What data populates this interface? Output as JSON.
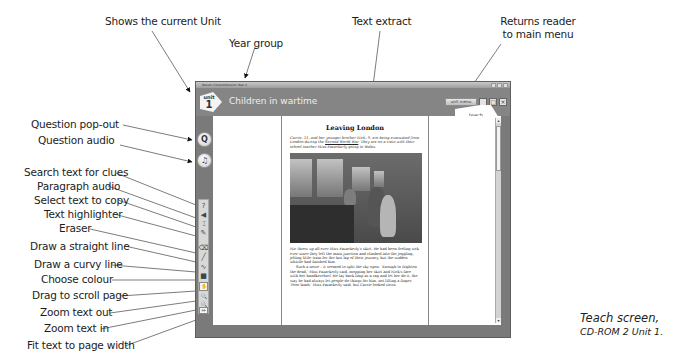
{
  "callouts": {
    "shows_unit": "Shows the current Unit",
    "year_group": "Year group",
    "text_extract": "Text extract",
    "returns_menu_l1": "Returns reader",
    "returns_menu_l2": "to main menu",
    "question_popout": "Question pop-out",
    "question_audio": "Question audio",
    "search_clues": "Search text for clues",
    "paragraph_audio": "Paragraph audio",
    "select_copy": "Select text to copy",
    "highlighter": "Text highlighter",
    "eraser": "Eraser",
    "straight_line": "Draw a straight line",
    "curvy_line": "Draw a curvy line",
    "choose_colour": "Choose colour",
    "drag_scroll": "Drag to scroll page",
    "zoom_out": "Zoom text out",
    "zoom_in": "Zoom text in",
    "fit_width": "Fit text to page width"
  },
  "window": {
    "title": "Nelson Comprehension Year 4",
    "unit_word": "unit",
    "unit_number": "1",
    "unit_title": "Children in wartime",
    "menu_button": "unit menu",
    "minimize": "_",
    "maximize": "□",
    "close": "×",
    "tab": "teach"
  },
  "round_buttons": {
    "question": "Q",
    "audio": "♫"
  },
  "tools": [
    {
      "name": "search-clues-icon",
      "glyph": "?"
    },
    {
      "name": "paragraph-audio-icon",
      "glyph": "◀"
    },
    {
      "name": "select-copy-icon",
      "glyph": "⌶"
    },
    {
      "name": "highlighter-icon",
      "glyph": "✎"
    },
    {
      "name": "eraser-icon",
      "glyph": "⌫"
    },
    {
      "name": "straight-line-icon",
      "glyph": "╱"
    },
    {
      "name": "curvy-line-icon",
      "glyph": "∿"
    },
    {
      "name": "colour-swatch-icon",
      "glyph": "■"
    },
    {
      "name": "hand-drag-icon",
      "glyph": "✋"
    },
    {
      "name": "zoom-out-icon",
      "glyph": "🔍"
    },
    {
      "name": "zoom-in-icon",
      "glyph": "🔍"
    },
    {
      "name": "fit-width-icon",
      "glyph": "⇔"
    }
  ],
  "page": {
    "title": "Leaving London",
    "intro_1": "Carrie, 11, and her younger brother Nick, 9, are being evacuated from London during the ",
    "intro_link": "Second World War",
    "intro_2": ". They are on a train with their school teacher Miss Fazackerly going to Wales.",
    "para_1": "Nic threw up all over Miss Fazackerly's skirt. He had been feeling sick ever since they left the main junction and climbed into the joggling, jolting little train for the last lap of their journey, but the sudden whistle had finished him.",
    "para_2": "Such a noise – it seemed to split the sky open. 'Enough to frighten the dead,' Miss Fazackerly said, mopping her skirt and Nick's face with her handkerchief. He lay back limp as a rag and let her do it, the way he had always let people do things for him, not lifting a finger. 'Poor lamb,' Miss Fazackerly said, but Carrie looked stern."
  },
  "caption": {
    "line1": "Teach screen,",
    "line2": "CD-ROM 2 Unit 1."
  }
}
